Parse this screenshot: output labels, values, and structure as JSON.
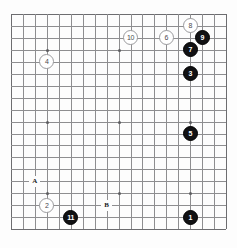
{
  "diagram": {
    "type": "go-board",
    "board_size": 19,
    "title": "",
    "background_color": "#fdfdfd",
    "line_color": "#8e8e90",
    "black_color": "#111113",
    "white_color": "#ffffff"
  },
  "geometry": {
    "origin_x": 11,
    "origin_y": 14,
    "spacing": 11.95,
    "stone_diameter": 15
  },
  "star_points": [
    {
      "col": 3,
      "row": 3
    },
    {
      "col": 9,
      "row": 3
    },
    {
      "col": 15,
      "row": 3
    },
    {
      "col": 3,
      "row": 9
    },
    {
      "col": 9,
      "row": 9
    },
    {
      "col": 15,
      "row": 9
    },
    {
      "col": 3,
      "row": 15
    },
    {
      "col": 9,
      "row": 15
    },
    {
      "col": 15,
      "row": 15
    }
  ],
  "stones": [
    {
      "label": "8",
      "color": "white",
      "col": 15,
      "row": 1
    },
    {
      "label": "9",
      "color": "black",
      "col": 16,
      "row": 2
    },
    {
      "label": "10",
      "color": "white",
      "col": 10,
      "row": 2
    },
    {
      "label": "6",
      "color": "white",
      "col": 13,
      "row": 2
    },
    {
      "label": "7",
      "color": "black",
      "col": 15,
      "row": 3
    },
    {
      "label": "4",
      "color": "white",
      "col": 3,
      "row": 4
    },
    {
      "label": "3",
      "color": "black",
      "col": 15,
      "row": 5
    },
    {
      "label": "5",
      "color": "black",
      "col": 15,
      "row": 10
    },
    {
      "label": "2",
      "color": "white",
      "col": 3,
      "row": 16
    },
    {
      "label": "11",
      "color": "black",
      "col": 5,
      "row": 17
    },
    {
      "label": "1",
      "color": "black",
      "col": 15,
      "row": 17
    }
  ],
  "markers": [
    {
      "label": "A",
      "col": 2,
      "row": 14
    },
    {
      "label": "B",
      "col": 8,
      "row": 16
    }
  ]
}
